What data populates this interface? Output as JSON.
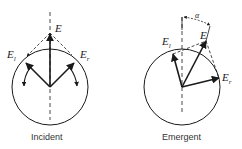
{
  "diagrams": [
    {
      "caption": "Incident",
      "labels": {
        "E": "E",
        "E_l": "E",
        "E_l_sub": "l",
        "E_r": "E",
        "E_r_sub": "r"
      }
    },
    {
      "caption": "Emergent",
      "labels": {
        "E": "E",
        "E_l": "E",
        "E_l_sub": "l",
        "E_r": "E",
        "E_r_sub": "r",
        "alpha": "α"
      }
    }
  ],
  "colors": {
    "ink": "#1a1a1a",
    "background": "#ffffff"
  }
}
